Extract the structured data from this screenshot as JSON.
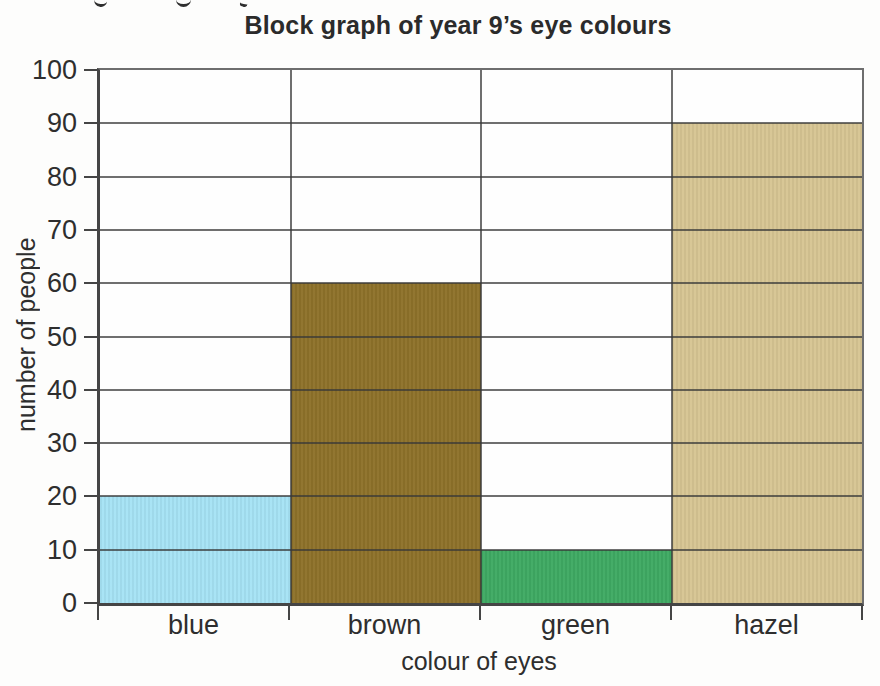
{
  "page": {
    "background_color": "#fdfdfc",
    "cropped_text_remnant": {
      "visible": true,
      "description": "bottom tips (descenders) of a cut-off line of text at the top edge",
      "marks": 3
    }
  },
  "chart_data": {
    "type": "bar",
    "variant": "block-graph (bars touch, spanning full category width)",
    "title": "Block graph of year 9’s eye colours",
    "xlabel": "colour of eyes",
    "ylabel": "number of people",
    "categories": [
      "blue",
      "brown",
      "green",
      "hazel"
    ],
    "values": [
      20,
      60,
      10,
      90
    ],
    "bar_colors": [
      "#a6e3f5",
      "#8e722a",
      "#3faa63",
      "#d7c593"
    ],
    "ylim": [
      0,
      100
    ],
    "ytick_interval": 10,
    "ytick_labels": [
      "0",
      "10",
      "20",
      "30",
      "40",
      "50",
      "60",
      "70",
      "80",
      "90",
      "100"
    ],
    "grid": true,
    "gridlines_cross_bars": true,
    "gridline_color": "#6a6a6a",
    "axis_color": "#454545",
    "text_color": "#2e2e2e",
    "legend": "none"
  }
}
